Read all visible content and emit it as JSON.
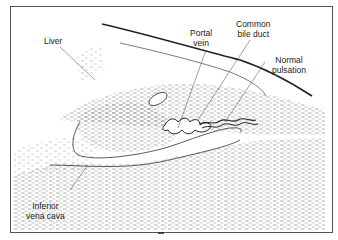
{
  "figure": {
    "type": "ultrasound schematic diagram",
    "labels": {
      "liver": "Liver",
      "portal_vein_1": "Portal",
      "portal_vein_2": "vein",
      "common_bile_duct_1": "Common",
      "common_bile_duct_2": "bile duct",
      "normal_pulsation_1": "Normal",
      "normal_pulsation_2": "pulsation",
      "ivc_1": "Inferior",
      "ivc_2": "vena cava"
    },
    "colors": {
      "ink": "#222222",
      "stipple": "#777777",
      "background": "#ffffff"
    }
  }
}
